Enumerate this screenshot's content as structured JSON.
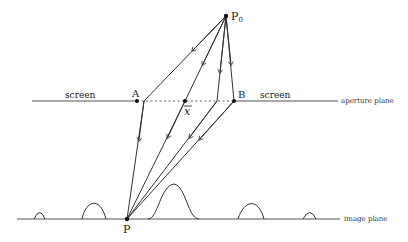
{
  "labels": {
    "source": "P",
    "source_sub": "0",
    "point_a": "A",
    "point_b": "B",
    "xbar": "x",
    "image_point": "P",
    "screen_left": "screen",
    "screen_right": "screen",
    "aperture_plane": "aperture plane",
    "image_plane": "image plane"
  },
  "colors": {
    "line": "#333333",
    "dotted": "#555555",
    "text": "#222222"
  }
}
